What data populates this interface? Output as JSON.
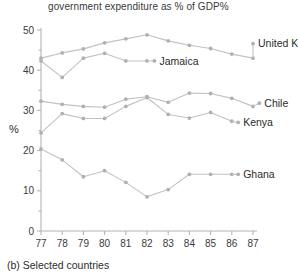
{
  "figure": {
    "caption": "(b) Selected countries",
    "axis_label_y": "%"
  },
  "chart_data": {
    "type": "line",
    "title": "government expenditure as % of GDP%",
    "xlabel": "",
    "ylabel": "%",
    "xlim": [
      77,
      87
    ],
    "ylim": [
      0,
      50
    ],
    "ytick_labels": [
      "0",
      "10",
      "20",
      "30",
      "40",
      "50"
    ],
    "ytick_values": [
      0,
      10,
      20,
      30,
      40,
      50
    ],
    "yticks_minor": [
      5,
      15,
      25,
      35,
      45
    ],
    "xtick_labels": [
      "77",
      "78",
      "79",
      "80",
      "81",
      "82",
      "83",
      "84",
      "85",
      "86",
      "87"
    ],
    "x": [
      77,
      78,
      79,
      80,
      81,
      82,
      83,
      84,
      85,
      86,
      87
    ],
    "grid": false,
    "legend_position": "inline-right-of-line",
    "marker": "circle",
    "line_color": "#c2c2c2",
    "marker_color": "#b0b0b0",
    "text_color": "#2b2b2b",
    "series": [
      {
        "name": "United Kingdom",
        "label": "United Kingdom",
        "x": [
          77,
          78,
          79,
          80,
          81,
          82,
          83,
          84,
          85,
          86,
          87
        ],
        "values": [
          43.0,
          44.3,
          45.3,
          46.8,
          47.8,
          48.8,
          47.3,
          46.2,
          45.4,
          44.0,
          43.0
        ],
        "label_x": 87.0,
        "label_y": 46.6
      },
      {
        "name": "Jamaica",
        "label": "Jamaica",
        "x": [
          77,
          78,
          79,
          80,
          81,
          82
        ],
        "values": [
          42.3,
          38.2,
          43.0,
          44.2,
          42.3,
          42.3
        ],
        "label_x": 82.35,
        "label_y": 42.3
      },
      {
        "name": "Chile",
        "label": "Chile",
        "x": [
          77,
          78,
          79,
          80,
          81,
          82,
          83,
          84,
          85,
          86,
          87
        ],
        "values": [
          32.3,
          31.5,
          31.0,
          30.8,
          32.8,
          33.4,
          32.0,
          34.3,
          34.2,
          33.0,
          31.0
        ],
        "label_x": 87.3,
        "label_y": 31.8
      },
      {
        "name": "Kenya",
        "label": "Kenya",
        "x": [
          77,
          78,
          79,
          80,
          81,
          82,
          83,
          84,
          85,
          86
        ],
        "values": [
          24.4,
          29.2,
          28.0,
          28.0,
          31.0,
          33.2,
          29.0,
          28.1,
          29.5,
          27.3
        ],
        "label_x": 86.3,
        "label_y": 27.0
      },
      {
        "name": "Ghana",
        "label": "Ghana",
        "x": [
          77,
          78,
          79,
          80,
          81,
          82,
          83,
          84,
          85,
          86
        ],
        "values": [
          20.4,
          17.7,
          13.5,
          15.0,
          12.1,
          8.5,
          10.3,
          14.1,
          14.1,
          14.1
        ],
        "label_x": 86.3,
        "label_y": 14.1
      }
    ]
  }
}
